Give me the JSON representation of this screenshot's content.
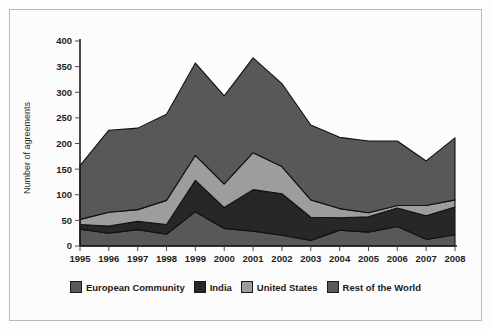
{
  "chart_data": {
    "type": "area",
    "stacked": true,
    "title": "",
    "xlabel": "",
    "ylabel": "Number of agreements",
    "categories": [
      "1995",
      "1996",
      "1997",
      "1998",
      "1999",
      "2000",
      "2001",
      "2002",
      "2003",
      "2004",
      "2005",
      "2006",
      "2007",
      "2008"
    ],
    "ylim": [
      0,
      400
    ],
    "ytick_values": [
      0,
      50,
      100,
      150,
      200,
      250,
      300,
      350,
      400
    ],
    "ytick_labels": [
      "0",
      "50",
      "100",
      "150",
      "200",
      "250",
      "300",
      "350",
      "400"
    ],
    "grid": false,
    "legend_position": "bottom",
    "stack_order_bottom_to_top": [
      "Rest of the World",
      "India",
      "United States",
      "European Community"
    ],
    "series": [
      {
        "name": "Rest of the World",
        "color": "#585858",
        "values": [
          33,
          25,
          32,
          23,
          67,
          34,
          29,
          21,
          11,
          31,
          27,
          38,
          13,
          22
        ]
      },
      {
        "name": "India",
        "color": "#272727",
        "values": [
          9,
          14,
          16,
          19,
          61,
          41,
          81,
          81,
          45,
          24,
          30,
          36,
          46,
          54
        ]
      },
      {
        "name": "United States",
        "color": "#9d9d9d",
        "values": [
          10,
          27,
          23,
          47,
          49,
          46,
          72,
          53,
          34,
          18,
          8,
          5,
          20,
          14
        ]
      },
      {
        "name": "European Community",
        "color": "#585858",
        "values": [
          105,
          160,
          159,
          168,
          180,
          172,
          185,
          162,
          146,
          139,
          140,
          126,
          87,
          121
        ]
      }
    ],
    "totals": [
      157,
      226,
      230,
      257,
      357,
      293,
      367,
      317,
      236,
      212,
      205,
      205,
      166,
      211
    ]
  },
  "legend": {
    "items": [
      {
        "label": "European Community",
        "color": "#585858"
      },
      {
        "label": "India",
        "color": "#272727"
      },
      {
        "label": "United States",
        "color": "#9d9d9d"
      },
      {
        "label": "Rest of the World",
        "color": "#585858"
      }
    ]
  }
}
